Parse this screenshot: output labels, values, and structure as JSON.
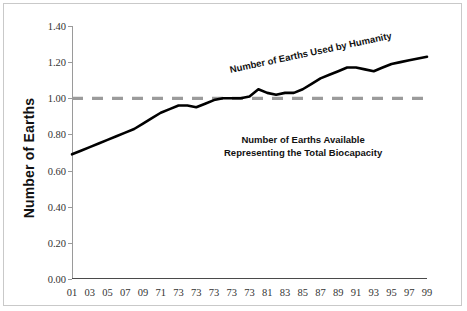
{
  "chart_data": {
    "type": "line",
    "title": "",
    "xlabel": "",
    "ylabel": "Number of Earths",
    "ylim": [
      0.0,
      1.4
    ],
    "yticks": [
      "0.00",
      "0.20",
      "0.40",
      "0.60",
      "0.80",
      "1.00",
      "1.20",
      "1.40"
    ],
    "ytick_values": [
      0.0,
      0.2,
      0.4,
      0.6,
      0.8,
      1.0,
      1.2,
      1.4
    ],
    "grid": false,
    "legend": "none",
    "categories": [
      "01",
      "03",
      "05",
      "07",
      "09",
      "71",
      "73",
      "73",
      "73",
      "73",
      "73",
      "81",
      "83",
      "85",
      "87",
      "89",
      "91",
      "93",
      "95",
      "97",
      "99"
    ],
    "x": [
      1,
      3,
      5,
      7,
      9,
      11,
      13,
      15,
      17,
      19,
      21,
      23,
      25,
      27,
      29,
      31,
      33,
      35,
      37,
      39,
      41
    ],
    "series": [
      {
        "name": "Number of Earths Used by Humanity",
        "style": "solid",
        "color": "#000000",
        "x": [
          1,
          2,
          3,
          4,
          5,
          6,
          7,
          8,
          9,
          10,
          11,
          12,
          13,
          14,
          15,
          16,
          17,
          18,
          19,
          20,
          21,
          22,
          23,
          24,
          25,
          26,
          27,
          28,
          29,
          30,
          31,
          32,
          33,
          34,
          35,
          36,
          37,
          38,
          39,
          40,
          41
        ],
        "values": [
          0.69,
          0.71,
          0.73,
          0.75,
          0.77,
          0.79,
          0.81,
          0.83,
          0.86,
          0.89,
          0.92,
          0.94,
          0.96,
          0.96,
          0.95,
          0.97,
          0.99,
          1.0,
          1.0,
          1.0,
          1.01,
          1.05,
          1.03,
          1.02,
          1.03,
          1.03,
          1.05,
          1.08,
          1.11,
          1.13,
          1.15,
          1.17,
          1.17,
          1.16,
          1.15,
          1.17,
          1.19,
          1.2,
          1.21,
          1.22,
          1.23
        ]
      },
      {
        "name": "Number of Earths Available Representing the Total Biocapacity",
        "style": "dashed",
        "color": "#9b9b9b",
        "constant_value": 1.0
      }
    ],
    "annotations": [
      {
        "id": "used",
        "text": "Number of Earths Used by Humanity",
        "rotated": true
      },
      {
        "id": "available_line1",
        "text": "Number of Earths Available"
      },
      {
        "id": "available_line2",
        "text": "Representing the Total Biocapacity"
      }
    ]
  },
  "axes": {
    "y_title": "Number of Earths"
  },
  "colors": {
    "line": "#000000",
    "dashed_line": "#9b9b9b",
    "axis": "#9a9a9a",
    "frame": "#c9c9c9",
    "background": "#ffffff",
    "text": "#111111"
  }
}
